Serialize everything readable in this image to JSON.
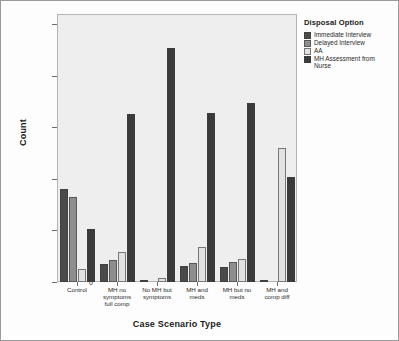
{
  "chart_data": {
    "type": "bar",
    "title": "",
    "xlabel": "Case Scenario Type",
    "ylabel": "Count",
    "ylim": [
      0,
      260
    ],
    "yticks": [
      0,
      50,
      100,
      150,
      200,
      250
    ],
    "ytick_labels": [
      "0",
      "50",
      "100",
      "150",
      "200",
      "250"
    ],
    "grid": false,
    "legend_position": "right",
    "legend_title": "Disposal Option",
    "categories": [
      "Control",
      "MH no\nsymptoms\nfull comp",
      "No MH but\nsymptoms",
      "MH and\nmeds",
      "MH but no\nmeds",
      "MH and\ncomp diff"
    ],
    "series": [
      {
        "name": "Immediate Interview",
        "color": "#4a4a4a",
        "values": [
          90,
          17,
          2,
          16,
          15,
          1
        ]
      },
      {
        "name": "Delayed Interview",
        "color": "#8e8e8e",
        "values": [
          82,
          21,
          0,
          18,
          19,
          0
        ]
      },
      {
        "name": "AA",
        "color": "#e2e2e2",
        "values": [
          13,
          29,
          4,
          34,
          22,
          130
        ]
      },
      {
        "name": "MH Assessment from\nNurse",
        "color": "#3a3a3a",
        "values": [
          51,
          163,
          227,
          164,
          174,
          102
        ]
      }
    ]
  },
  "style": {
    "plot_background": "#eeeeee",
    "figure_background": "#fdfdfd",
    "frame_color": "#b4b4b4",
    "border_color": "#9a9a9a",
    "text_color": "#2a2a2a"
  }
}
